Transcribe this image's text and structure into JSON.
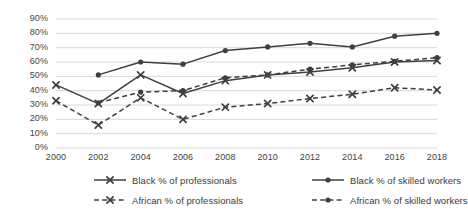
{
  "chart_data": {
    "type": "line",
    "title": "",
    "xlabel": "",
    "ylabel": "",
    "categories": [
      "2000",
      "2002",
      "2004",
      "2006",
      "2008",
      "2010",
      "2012",
      "2014",
      "2016",
      "2018"
    ],
    "x": [
      2000,
      2002,
      2004,
      2006,
      2008,
      2010,
      2012,
      2014,
      2016,
      2018
    ],
    "ylim": [
      0,
      90
    ],
    "ytick_labels": [
      "0%",
      "10%",
      "20%",
      "30%",
      "40%",
      "50%",
      "60%",
      "70%",
      "80%",
      "90%"
    ],
    "ytick_values": [
      0,
      10,
      20,
      30,
      40,
      50,
      60,
      70,
      80,
      90
    ],
    "grid": true,
    "legend_position": "bottom",
    "series": [
      {
        "name": "Black % of professionals",
        "line_style": "solid",
        "marker": "x",
        "color": "#3f3f3f",
        "values": [
          44,
          31,
          51,
          38,
          47,
          51,
          53,
          56,
          60,
          61
        ]
      },
      {
        "name": "Black % of skilled workers",
        "line_style": "solid",
        "marker": "circle",
        "color": "#3f3f3f",
        "values": [
          null,
          51,
          60,
          58.5,
          68,
          70.5,
          73,
          70.5,
          78,
          80
        ]
      },
      {
        "name": "African % of professionals",
        "line_style": "dashed",
        "marker": "x",
        "color": "#3f3f3f",
        "values": [
          33,
          16,
          35,
          20,
          28.5,
          31,
          34.5,
          37.5,
          42,
          40.5
        ]
      },
      {
        "name": "African % of skilled workers",
        "line_style": "dashed",
        "marker": "circle",
        "color": "#3f3f3f",
        "values": [
          null,
          31.5,
          39,
          40,
          49,
          51,
          55,
          58,
          60.5,
          63
        ]
      }
    ]
  }
}
